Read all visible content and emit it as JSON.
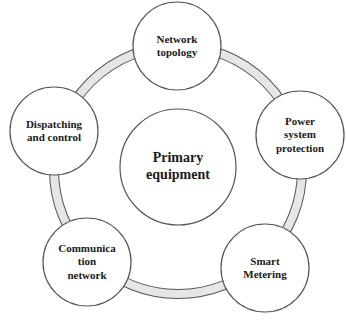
{
  "diagram": {
    "type": "hub-and-ring",
    "ring_fill": "#e6e6e6",
    "stroke_color": "#555555",
    "center": {
      "label": "Primary\nequipment"
    },
    "nodes": [
      {
        "id": "network-topology",
        "label": "Network\ntopology"
      },
      {
        "id": "power-system-protection",
        "label": "Power\nsystem\nprotection"
      },
      {
        "id": "smart-metering",
        "label": "Smart\nMetering"
      },
      {
        "id": "communication-network",
        "label": "Communica\ntion\nnetwork"
      },
      {
        "id": "dispatching-and-control",
        "label": "Dispatching\nand control"
      }
    ]
  }
}
